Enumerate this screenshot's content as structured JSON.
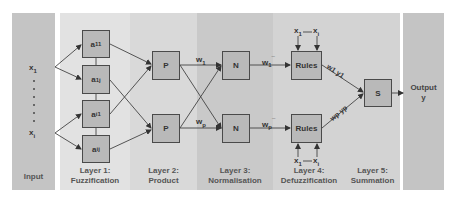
{
  "columns": [
    {
      "id": "input",
      "label": "Input",
      "color": "#c4c4c4"
    },
    {
      "id": "layer1",
      "label": "Layer 1:\nFuzzification",
      "color": "#e2e2e2"
    },
    {
      "id": "layer2",
      "label": "Layer 2:\nProduct",
      "color": "#d9d9d9"
    },
    {
      "id": "layer3",
      "label": "Layer 3:\nNormalisation",
      "color": "#c9c9c9"
    },
    {
      "id": "layer4",
      "label": "Layer 4:\nDefuzzification",
      "color": "#d3d3d3"
    },
    {
      "id": "layer5",
      "label": "Layer 5:\nSummation",
      "color": "#d3d3d3"
    },
    {
      "id": "output",
      "label": "",
      "color": "#c4c4c4"
    }
  ],
  "labels": {
    "input_label": "Input",
    "layer1_a": "Layer 1:",
    "layer1_b": "Fuzzification",
    "layer2_a": "Layer 2:",
    "layer2_b": "Product",
    "layer3_a": "Layer 3:",
    "layer3_b": "Normalisation",
    "layer4_a": "Layer 4:",
    "layer4_b": "Defuzzification",
    "layer5_a": "Layer 5:",
    "layer5_b": "Summation",
    "output_a": "Output",
    "output_b": "y"
  },
  "inputs": {
    "x1": {
      "base": "x",
      "sub": "1"
    },
    "xi": {
      "base": "x",
      "sub": "i"
    }
  },
  "fuzzification_nodes": [
    {
      "base": "a",
      "sub": "11"
    },
    {
      "base": "a",
      "sub": "1j"
    },
    {
      "base": "a",
      "sub": "i1"
    },
    {
      "base": "a",
      "sub": "ij"
    }
  ],
  "product_nodes": [
    "P",
    "P"
  ],
  "normalisation_nodes": [
    "N",
    "N"
  ],
  "rule_nodes": [
    "Rules",
    "Rules"
  ],
  "summation_node": "S",
  "weights": {
    "w1": {
      "base": "w",
      "sub": "1"
    },
    "wp": {
      "base": "w",
      "sub": "p"
    },
    "w1_bar": {
      "base": "w",
      "sub": "1",
      "sup": "¯"
    },
    "wp_bar": {
      "base": "w",
      "sub": "p",
      "sup": "¯"
    },
    "w1y1": "w1 y1",
    "wpyp": "wp yp"
  },
  "rule_inputs": {
    "first": {
      "base": "x",
      "sub": "1"
    },
    "last": {
      "base": "x",
      "sub": "i"
    }
  }
}
